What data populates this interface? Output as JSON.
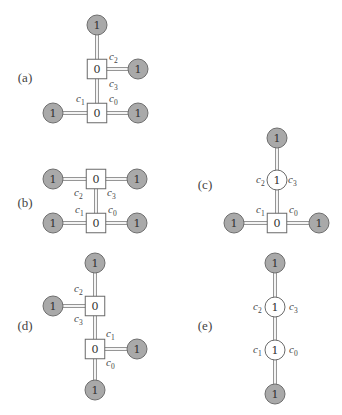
{
  "colors": {
    "gray_fill": "#a9a9a9",
    "gray_stroke": "#6e6e6e",
    "box_stroke": "#6a6a6a",
    "edge": "#8a8a8a",
    "text": "#333333"
  },
  "panels": [
    {
      "id": "a",
      "label": "(a)",
      "label_pos": [
        25,
        77
      ],
      "nodes": [
        {
          "id": "a_top",
          "shape": "gray-circle",
          "value": "1",
          "x": 97,
          "y": 25
        },
        {
          "id": "a_sq1",
          "shape": "square",
          "value": "0",
          "x": 97,
          "y": 69
        },
        {
          "id": "a_r1",
          "shape": "gray-circle",
          "value": "1",
          "x": 138,
          "y": 69
        },
        {
          "id": "a_sq2",
          "shape": "square",
          "value": "0",
          "x": 97,
          "y": 113
        },
        {
          "id": "a_l2",
          "shape": "gray-circle",
          "value": "1",
          "x": 53,
          "y": 113
        },
        {
          "id": "a_r2",
          "shape": "gray-circle",
          "value": "1",
          "x": 138,
          "y": 113
        }
      ],
      "edges": [
        [
          "a_top",
          "a_sq1"
        ],
        [
          "a_sq1",
          "a_r1"
        ],
        [
          "a_sq1",
          "a_sq2"
        ],
        [
          "a_l2",
          "a_sq2"
        ],
        [
          "a_sq2",
          "a_r2"
        ]
      ],
      "corner_labels": [
        {
          "base": "c",
          "sub": "2",
          "x": 109,
          "y": 60
        },
        {
          "base": "c",
          "sub": "3",
          "x": 109,
          "y": 87
        },
        {
          "base": "c",
          "sub": "1",
          "x": 76,
          "y": 102
        },
        {
          "base": "c",
          "sub": "0",
          "x": 109,
          "y": 102
        }
      ]
    },
    {
      "id": "b",
      "label": "(b)",
      "label_pos": [
        25,
        202
      ],
      "nodes": [
        {
          "id": "b_sq1",
          "shape": "square",
          "value": "0",
          "x": 96,
          "y": 179
        },
        {
          "id": "b_l1",
          "shape": "gray-circle",
          "value": "1",
          "x": 53,
          "y": 179
        },
        {
          "id": "b_r1",
          "shape": "gray-circle",
          "value": "1",
          "x": 137,
          "y": 179
        },
        {
          "id": "b_sq2",
          "shape": "square",
          "value": "0",
          "x": 96,
          "y": 223
        },
        {
          "id": "b_l2",
          "shape": "gray-circle",
          "value": "1",
          "x": 53,
          "y": 223
        },
        {
          "id": "b_r2",
          "shape": "gray-circle",
          "value": "1",
          "x": 137,
          "y": 223
        }
      ],
      "edges": [
        [
          "b_l1",
          "b_sq1"
        ],
        [
          "b_sq1",
          "b_r1"
        ],
        [
          "b_sq1",
          "b_sq2"
        ],
        [
          "b_l2",
          "b_sq2"
        ],
        [
          "b_sq2",
          "b_r2"
        ]
      ],
      "corner_labels": [
        {
          "base": "c",
          "sub": "2",
          "x": 74,
          "y": 196
        },
        {
          "base": "c",
          "sub": "3",
          "x": 107,
          "y": 196
        },
        {
          "base": "c",
          "sub": "1",
          "x": 75,
          "y": 213
        },
        {
          "base": "c",
          "sub": "0",
          "x": 108,
          "y": 213
        }
      ]
    },
    {
      "id": "c",
      "label": "(c)",
      "label_pos": [
        205,
        184
      ],
      "nodes": [
        {
          "id": "c_top",
          "shape": "gray-circle",
          "value": "1",
          "x": 277,
          "y": 138
        },
        {
          "id": "c_w",
          "shape": "white-circle",
          "value": "1",
          "x": 277,
          "y": 180
        },
        {
          "id": "c_sq",
          "shape": "square",
          "value": "0",
          "x": 277,
          "y": 223
        },
        {
          "id": "c_l",
          "shape": "gray-circle",
          "value": "1",
          "x": 234,
          "y": 223
        },
        {
          "id": "c_r",
          "shape": "gray-circle",
          "value": "1",
          "x": 319,
          "y": 223
        }
      ],
      "edges": [
        [
          "c_top",
          "c_w"
        ],
        [
          "c_w",
          "c_sq"
        ],
        [
          "c_l",
          "c_sq"
        ],
        [
          "c_sq",
          "c_r"
        ]
      ],
      "corner_labels": [
        {
          "base": "c",
          "sub": "2",
          "x": 256,
          "y": 183
        },
        {
          "base": "c",
          "sub": "3",
          "x": 288,
          "y": 183
        },
        {
          "base": "c",
          "sub": "1",
          "x": 256,
          "y": 213
        },
        {
          "base": "c",
          "sub": "0",
          "x": 289,
          "y": 213
        }
      ]
    },
    {
      "id": "d",
      "label": "(d)",
      "label_pos": [
        25,
        325
      ],
      "nodes": [
        {
          "id": "d_top",
          "shape": "gray-circle",
          "value": "1",
          "x": 95,
          "y": 263
        },
        {
          "id": "d_sq1",
          "shape": "square",
          "value": "0",
          "x": 95,
          "y": 306
        },
        {
          "id": "d_l1",
          "shape": "gray-circle",
          "value": "1",
          "x": 53,
          "y": 306
        },
        {
          "id": "d_sq2",
          "shape": "square",
          "value": "0",
          "x": 95,
          "y": 349
        },
        {
          "id": "d_r2",
          "shape": "gray-circle",
          "value": "1",
          "x": 137,
          "y": 349
        },
        {
          "id": "d_bot",
          "shape": "gray-circle",
          "value": "1",
          "x": 95,
          "y": 390
        }
      ],
      "edges": [
        [
          "d_top",
          "d_sq1"
        ],
        [
          "d_l1",
          "d_sq1"
        ],
        [
          "d_sq1",
          "d_sq2"
        ],
        [
          "d_sq2",
          "d_r2"
        ],
        [
          "d_sq2",
          "d_bot"
        ]
      ],
      "corner_labels": [
        {
          "base": "c",
          "sub": "2",
          "x": 74,
          "y": 292
        },
        {
          "base": "c",
          "sub": "3",
          "x": 74,
          "y": 322
        },
        {
          "base": "c",
          "sub": "1",
          "x": 106,
          "y": 337
        },
        {
          "base": "c",
          "sub": "0",
          "x": 106,
          "y": 366
        }
      ]
    },
    {
      "id": "e",
      "label": "(e)",
      "label_pos": [
        205,
        325
      ],
      "nodes": [
        {
          "id": "e_top",
          "shape": "gray-circle",
          "value": "1",
          "x": 275,
          "y": 263
        },
        {
          "id": "e_w1",
          "shape": "white-circle",
          "value": "1",
          "x": 275,
          "y": 307
        },
        {
          "id": "e_w2",
          "shape": "white-circle",
          "value": "1",
          "x": 275,
          "y": 350
        },
        {
          "id": "e_bot",
          "shape": "gray-circle",
          "value": "1",
          "x": 275,
          "y": 394
        }
      ],
      "edges": [
        [
          "e_top",
          "e_w1"
        ],
        [
          "e_w1",
          "e_w2"
        ],
        [
          "e_w2",
          "e_bot"
        ]
      ],
      "corner_labels": [
        {
          "base": "c",
          "sub": "2",
          "x": 253,
          "y": 310
        },
        {
          "base": "c",
          "sub": "3",
          "x": 289,
          "y": 310
        },
        {
          "base": "c",
          "sub": "1",
          "x": 253,
          "y": 353
        },
        {
          "base": "c",
          "sub": "0",
          "x": 289,
          "y": 353
        }
      ]
    }
  ]
}
